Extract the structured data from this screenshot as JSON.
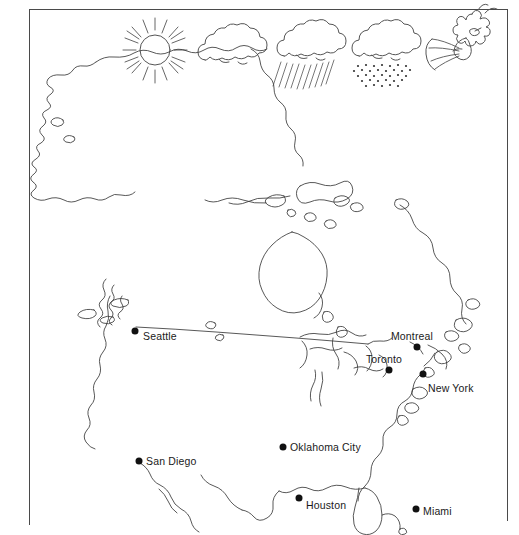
{
  "figure": {
    "background_color": "#ffffff",
    "line_color": "#3a3a3a",
    "frame_color": "#4a4a4a",
    "label_color": "#1a1a1a",
    "marker_color": "#111111"
  },
  "weather_icons": [
    {
      "name": "sun-icon",
      "label": "sun",
      "x": 155,
      "y": 50
    },
    {
      "name": "cloud-icon",
      "label": "cloud",
      "x": 231,
      "y": 50
    },
    {
      "name": "rain-icon",
      "label": "rain",
      "x": 308,
      "y": 50
    },
    {
      "name": "snow-icon",
      "label": "snow",
      "x": 383,
      "y": 50
    },
    {
      "name": "wind-icon",
      "label": "wind",
      "x": 460,
      "y": 48
    }
  ],
  "cities": [
    {
      "name": "Seattle",
      "dot_x": 135,
      "dot_y": 331,
      "label_x": 143,
      "label_y": 336,
      "anchor": "right"
    },
    {
      "name": "Montreal",
      "dot_x": 417,
      "dot_y": 347,
      "label_x": 412,
      "label_y": 336,
      "anchor": "above"
    },
    {
      "name": "Toronto",
      "dot_x": 389,
      "dot_y": 370,
      "label_x": 384,
      "label_y": 359,
      "anchor": "above"
    },
    {
      "name": "New York",
      "dot_x": 423,
      "dot_y": 374,
      "label_x": 428,
      "label_y": 388,
      "anchor": "right"
    },
    {
      "name": "San Diego",
      "dot_x": 139,
      "dot_y": 461,
      "label_x": 146,
      "label_y": 461,
      "anchor": "right"
    },
    {
      "name": "Oklahoma City",
      "dot_x": 283,
      "dot_y": 447,
      "label_x": 290,
      "label_y": 447,
      "anchor": "right"
    },
    {
      "name": "Houston",
      "dot_x": 299,
      "dot_y": 498,
      "label_x": 306,
      "label_y": 505,
      "anchor": "right"
    },
    {
      "name": "Miami",
      "dot_x": 416,
      "dot_y": 509,
      "label_x": 423,
      "label_y": 511,
      "anchor": "right"
    }
  ]
}
